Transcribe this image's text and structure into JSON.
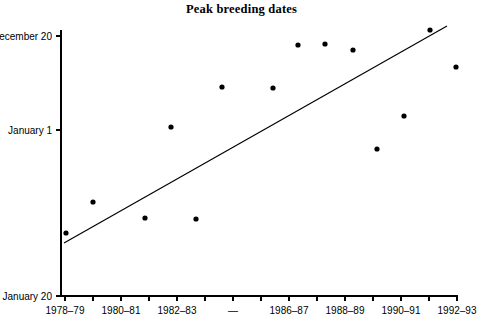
{
  "chart_data": {
    "type": "scatter",
    "title": "Peak breeding dates",
    "xlabel": "",
    "ylabel": "",
    "grid": false,
    "legend": false,
    "x_tick_labels": [
      "1978–79",
      "1980–81",
      "1982–83",
      "—",
      "1986–87",
      "1988–89",
      "1990–91",
      "1992–93"
    ],
    "y_tick_labels": [
      "ecember 20",
      "January 1",
      "January 20"
    ],
    "y_tick_values": [
      "December 20",
      "January 1",
      "January 20"
    ],
    "y_axis_note": "y axis increases upward toward December 20 (earlier breeding date); top label is clipped at the left image edge",
    "ylim_labels": [
      "January 20",
      "December 20"
    ],
    "categories": [
      "1977–78",
      "1978–79",
      "1979–80",
      "1980–81",
      "1981–82",
      "1982–83",
      "1983–84",
      "1984–85",
      "1985–86",
      "1986–87",
      "1987–88",
      "1988–89",
      "1989–90",
      "1990–91",
      "1991–92",
      "1992–93"
    ],
    "points": [
      {
        "x_index": 0,
        "season": "1977–78",
        "date": "January 16"
      },
      {
        "x_index": 1,
        "season": "1978–79",
        "date": "January 13"
      },
      {
        "x_index": 2,
        "season": "1979–80",
        "date": "January 15"
      },
      {
        "x_index": 3,
        "season": "1980–81",
        "date": "January 15"
      },
      {
        "x_index": 4,
        "season": "1981–82",
        "date": "January 3"
      },
      {
        "x_index": 5,
        "season": "1982–83",
        "date": "January 9"
      },
      {
        "x_index": 6,
        "season": "1983–84",
        "date": "December 26"
      },
      {
        "x_index": 7,
        "season": "1984–85",
        "date": "December 26"
      },
      {
        "x_index": 8,
        "season": "1985–86",
        "date": "December 21"
      },
      {
        "x_index": 9,
        "season": "1986–87",
        "date": "December 21"
      },
      {
        "x_index": 10,
        "season": "1987–88",
        "date": "December 22"
      },
      {
        "x_index": 11,
        "season": "1988–89",
        "date": "January 4"
      },
      {
        "x_index": 12,
        "season": "1989–90",
        "date": "January 1"
      },
      {
        "x_index": 13,
        "season": "1990–91",
        "date": "December 20"
      },
      {
        "x_index": 14,
        "season": "1991–92",
        "date": "December 24"
      }
    ],
    "pixel_points": [
      [
        66,
        233
      ],
      [
        93,
        202
      ],
      [
        145,
        218
      ],
      [
        171,
        127
      ],
      [
        196,
        219
      ],
      [
        222,
        87
      ],
      [
        273,
        88
      ],
      [
        298,
        45
      ],
      [
        325,
        44
      ],
      [
        353,
        50
      ],
      [
        377,
        149
      ],
      [
        404,
        116
      ],
      [
        430,
        30
      ],
      [
        456,
        67
      ]
    ],
    "trend_line": {
      "description": "linear regression line, rising left to right",
      "pixel_start": [
        64,
        243
      ],
      "pixel_end": [
        447,
        26
      ]
    }
  },
  "axes": {
    "y_axis_pixel_x": 61,
    "y_axis_pixel_top": 30,
    "y_axis_pixel_bottom": 296,
    "x_axis_pixel_y": 296,
    "x_axis_pixel_left": 61,
    "x_axis_pixel_right": 458,
    "y_ticks_pixel": [
      36,
      130,
      296
    ],
    "x_ticks_pixel": [
      65,
      93,
      121,
      149,
      177,
      205,
      233,
      261,
      289,
      317,
      345,
      373,
      401,
      429,
      457
    ],
    "x_labeled_ticks_pixel": [
      65,
      121,
      177,
      233,
      289,
      345,
      401,
      457
    ]
  }
}
